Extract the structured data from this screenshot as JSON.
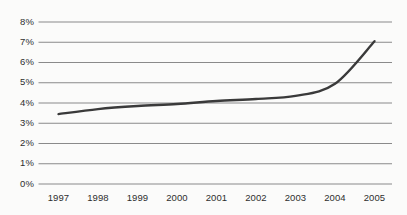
{
  "chart_data": {
    "type": "line",
    "title": "",
    "subtitle": "",
    "xlabel": "",
    "ylabel": "",
    "grid": true,
    "legend": false,
    "legend_position": "none",
    "categories": [
      "1997",
      "1998",
      "1999",
      "2000",
      "2001",
      "2002",
      "2003",
      "2004",
      "2005"
    ],
    "x": [
      1997,
      1998,
      1999,
      2000,
      2001,
      2002,
      2003,
      2004,
      2005
    ],
    "values": [
      3.45,
      3.7,
      3.85,
      3.95,
      4.1,
      4.2,
      4.35,
      4.95,
      7.05
    ],
    "series": [
      {
        "name": "",
        "values": [
          3.45,
          3.7,
          3.85,
          3.95,
          4.1,
          4.2,
          4.35,
          4.95,
          7.05
        ],
        "color": "#3a3a3a",
        "line_width": 2.4,
        "smooth": true
      }
    ],
    "ylim": [
      0,
      8
    ],
    "xlim": [
      1997,
      2005
    ],
    "ytick_labels": [
      "0%",
      "1%",
      "2%",
      "3%",
      "4%",
      "5%",
      "6%",
      "7%",
      "8%"
    ],
    "ytick_values": [
      0,
      1,
      2,
      3,
      4,
      5,
      6,
      7,
      8
    ],
    "xtick_labels": [
      "1997",
      "1998",
      "1999",
      "2000",
      "2001",
      "2002",
      "2003",
      "2004",
      "2005"
    ]
  },
  "style": {
    "background_color": "#fbfbfa",
    "gridline_color": "#8a8a8a",
    "line_color": "#3a3a3a",
    "tick_text_color": "#2e2e2e"
  }
}
